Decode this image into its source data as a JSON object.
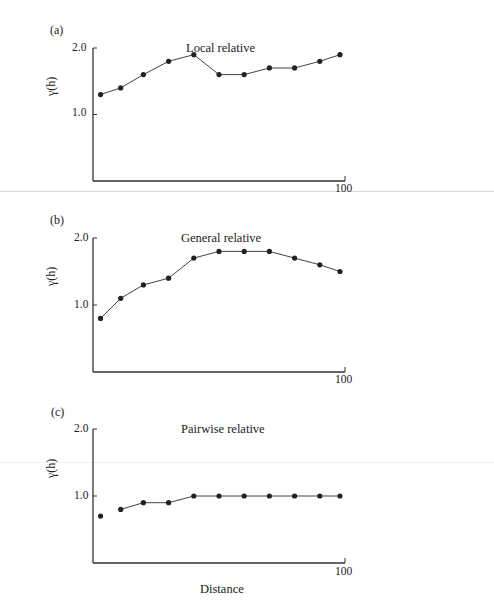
{
  "figure": {
    "x_label": "Distance",
    "y_label": "γ(h)",
    "x_tick_end": "100",
    "y_ticks": [
      "2.0",
      "1.0"
    ]
  },
  "panels": [
    {
      "tag": "(a)",
      "title": "Local relative"
    },
    {
      "tag": "(b)",
      "title": "General relative"
    },
    {
      "tag": "(c)",
      "title": "Pairwise relative"
    }
  ],
  "chart_data": [
    {
      "type": "line",
      "title": "Local relative",
      "panel": "(a)",
      "xlabel": "",
      "ylabel": "γ(h)",
      "x": [
        3,
        11,
        20,
        30,
        40,
        50,
        60,
        70,
        80,
        90,
        98
      ],
      "values": [
        1.3,
        1.4,
        1.6,
        1.8,
        1.9,
        1.6,
        1.6,
        1.7,
        1.7,
        1.8,
        1.9
      ],
      "xlim": [
        0,
        100
      ],
      "ylim": [
        0,
        2.0
      ],
      "yticks": [
        1.0,
        2.0
      ],
      "xticks": [
        100
      ],
      "grid": false,
      "markers": "filled-circle"
    },
    {
      "type": "line",
      "title": "General relative",
      "panel": "(b)",
      "xlabel": "",
      "ylabel": "γ(h)",
      "x": [
        3,
        11,
        20,
        30,
        40,
        50,
        60,
        70,
        80,
        90,
        98
      ],
      "values": [
        0.8,
        1.1,
        1.3,
        1.4,
        1.7,
        1.8,
        1.8,
        1.8,
        1.7,
        1.6,
        1.5
      ],
      "xlim": [
        0,
        100
      ],
      "ylim": [
        0,
        2.0
      ],
      "yticks": [
        1.0,
        2.0
      ],
      "xticks": [
        100
      ],
      "grid": false,
      "markers": "filled-circle"
    },
    {
      "type": "line",
      "title": "Pairwise relative",
      "panel": "(c)",
      "xlabel": "Distance",
      "ylabel": "γ(h)",
      "x": [
        3,
        11,
        20,
        30,
        40,
        50,
        60,
        70,
        80,
        90,
        98
      ],
      "values": [
        0.7,
        0.8,
        0.9,
        0.9,
        1.0,
        1.0,
        1.0,
        1.0,
        1.0,
        1.0,
        1.0
      ],
      "note": "first point drawn unconnected",
      "xlim": [
        0,
        100
      ],
      "ylim": [
        0,
        2.0
      ],
      "yticks": [
        1.0,
        2.0
      ],
      "xticks": [
        100
      ],
      "grid": false,
      "markers": "filled-circle"
    }
  ]
}
